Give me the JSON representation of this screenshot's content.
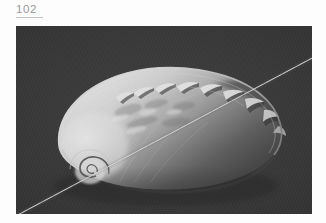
{
  "page": {
    "folio_number": "102",
    "background_color": "#fdfdfd",
    "rule_color": "#c2c2c2"
  },
  "plate": {
    "name": "abalone-shell-photograph",
    "alt": "Black and white photograph of the nacreous interior of an abalone (Haliotis) shell on a dark textured background, crossed by a fine white diagonal scratch",
    "caption": "",
    "colors": {
      "background_dark": "#3b3b3b",
      "background_darker": "#2e2e2e",
      "nacre_bright": "#f2f2f2",
      "nacre_mid": "#b9b9b9",
      "shell_shadow": "#4a4a4a",
      "rim_highlight": "#e8e8e8",
      "scratch_line": "#e6e6e6"
    },
    "subject": "abalone shell interior",
    "features": [
      "spiral apex at lower left",
      "row of respiratory pores along upper margin",
      "iridescent nacre body",
      "curved outer rim",
      "diagonal white scratch line"
    ],
    "pore_count": "9",
    "scratch": {
      "from": "bottom-left",
      "to": "top-right"
    }
  }
}
